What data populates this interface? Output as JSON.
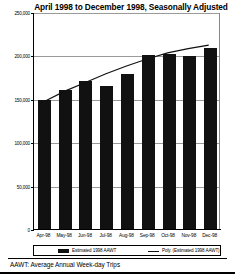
{
  "chart_data": {
    "type": "bar",
    "title": "April 1998 to December 1998, Seasonally Adjusted",
    "xlabel": "",
    "ylabel": "",
    "categories": [
      "Apr-98",
      "May-98",
      "Jun-98",
      "Jul-98",
      "Aug-98",
      "Sep-98",
      "Oct-98",
      "Nov-98",
      "Dec-98"
    ],
    "values": [
      150000,
      161000,
      172000,
      166000,
      180000,
      202000,
      203000,
      200000,
      210000
    ],
    "series": [
      {
        "name": "Estimated 1998 AAWT",
        "type": "bar",
        "values": [
          150000,
          161000,
          172000,
          166000,
          180000,
          202000,
          203000,
          200000,
          210000
        ]
      },
      {
        "name": "Poly. (Estimated 1998 AAWT)",
        "type": "line",
        "values": [
          148000,
          160000,
          170000,
          180000,
          189000,
          197000,
          204000,
          209000,
          213000
        ]
      }
    ],
    "ylim": [
      0,
      250000
    ],
    "yticks": [
      0,
      50000,
      100000,
      150000,
      200000,
      250000
    ],
    "ytick_labels": [
      "0",
      "50,000",
      "100,000",
      "150,000",
      "200,000",
      "250,000"
    ],
    "grid": true,
    "legend_position": "bottom"
  },
  "legend": {
    "bar_entry": "Estimated 1998 AAWT",
    "line_entry": "Poly. (Estimated 1998 AAWT)"
  },
  "footnote": "AAWT:  Average Annual Week-day Trips",
  "colors": {
    "bar": "#111111",
    "trendline": "#111111",
    "gridline": "#9a9a9a",
    "axis": "#000000"
  }
}
